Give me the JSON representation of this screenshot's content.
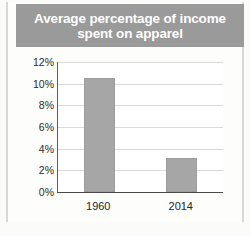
{
  "chart_data": {
    "type": "bar",
    "title": "Average percentage of income spent on apparel",
    "title_lines": [
      "Average percentage of income",
      "spent on apparel"
    ],
    "categories": [
      "1960",
      "2014"
    ],
    "values": [
      10.5,
      3.1
    ],
    "xlabel": "",
    "ylabel": "",
    "ylim": [
      0,
      12
    ],
    "ytick_labels": [
      "12%",
      "10%",
      "8%",
      "6%",
      "4%",
      "2%",
      "0%"
    ],
    "ytick_values": [
      12,
      10,
      8,
      6,
      4,
      2,
      0
    ],
    "grid": true,
    "legend": "none",
    "bar_color": "#a6a6a6",
    "title_banner_color": "#9a9a9a",
    "title_text_color": "#ffffff",
    "plot_background": "#ffffff",
    "gridline_color": "#d9d9d9",
    "axis_color": "#4a4a4a"
  }
}
